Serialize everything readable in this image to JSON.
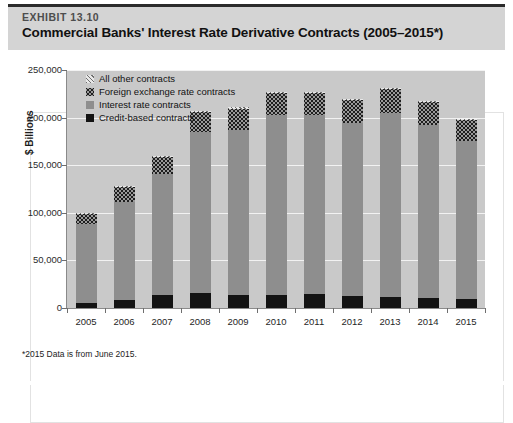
{
  "header": {
    "exhibit_label": "EXHIBIT 13.10",
    "title": "Commercial Banks' Interest Rate Derivative Contracts (2005–2015*)"
  },
  "footnote": "*2015 Data is from June 2015.",
  "legend": {
    "items": [
      {
        "label": "All other contracts",
        "swatch": "hatched-diagonal",
        "color": "#dcdcdc"
      },
      {
        "label": "Foreign exchange rate contracts",
        "swatch": "dotted-checker",
        "color": "#9a9a9a"
      },
      {
        "label": "Interest rate contracts",
        "swatch": "solid-gray",
        "color": "#8e8e8e"
      },
      {
        "label": "Credit-based contracts",
        "swatch": "solid-black",
        "color": "#131313"
      }
    ]
  },
  "chart_data": {
    "type": "bar",
    "stacked": true,
    "title": "Commercial Banks' Interest Rate Derivative Contracts (2005–2015*)",
    "xlabel": "",
    "ylabel": "$ Billions",
    "ylim": [
      0,
      250000
    ],
    "yticks": [
      0,
      50000,
      100000,
      150000,
      200000,
      250000
    ],
    "ytick_labels": [
      "0",
      "50,000",
      "100,000",
      "150,000",
      "200,000",
      "250,000"
    ],
    "grid": true,
    "legend_position": "top-left-inside",
    "categories": [
      "2005",
      "2006",
      "2007",
      "2008",
      "2009",
      "2010",
      "2011",
      "2012",
      "2013",
      "2014",
      "2015"
    ],
    "series": [
      {
        "name": "Credit-based contracts",
        "color": "#131313",
        "values": [
          5500,
          8000,
          14000,
          15500,
          13500,
          14000,
          14500,
          13000,
          12000,
          10500,
          9500
        ]
      },
      {
        "name": "Interest rate contracts",
        "color": "#8e8e8e",
        "values": [
          83000,
          103000,
          127000,
          169000,
          174000,
          189000,
          188000,
          181000,
          193000,
          182000,
          166000
        ]
      },
      {
        "name": "Foreign exchange rate contracts",
        "color": "#9a9a9a",
        "values": [
          10500,
          16000,
          18000,
          21000,
          22000,
          22500,
          23000,
          24000,
          25000,
          23500,
          21500
        ]
      },
      {
        "name": "All other contracts",
        "color": "#dcdcdc",
        "values": [
          1000,
          1000,
          1000,
          1500,
          1500,
          1500,
          1500,
          1000,
          1000,
          1000,
          1000
        ]
      }
    ],
    "totals": [
      100000,
      128000,
      160000,
      207000,
      211000,
      227000,
      227000,
      219000,
      231000,
      217000,
      198000
    ]
  }
}
